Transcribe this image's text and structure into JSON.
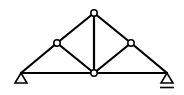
{
  "diagram": {
    "type": "truss",
    "nodes": [
      {
        "id": "A",
        "x": 21,
        "y": 73
      },
      {
        "id": "B",
        "x": 57,
        "y": 43
      },
      {
        "id": "C",
        "x": 94,
        "y": 13
      },
      {
        "id": "D",
        "x": 131,
        "y": 43
      },
      {
        "id": "E",
        "x": 167,
        "y": 73
      },
      {
        "id": "F",
        "x": 94,
        "y": 73
      }
    ],
    "members": [
      [
        "A",
        "B"
      ],
      [
        "B",
        "C"
      ],
      [
        "C",
        "D"
      ],
      [
        "D",
        "E"
      ],
      [
        "A",
        "F"
      ],
      [
        "F",
        "E"
      ],
      [
        "B",
        "F"
      ],
      [
        "C",
        "F"
      ],
      [
        "D",
        "F"
      ]
    ],
    "supports": [
      {
        "node": "A",
        "type": "pin"
      },
      {
        "node": "E",
        "type": "roller"
      }
    ],
    "colors": {
      "stroke": "#000000",
      "node_fill": "#ffffff"
    }
  }
}
